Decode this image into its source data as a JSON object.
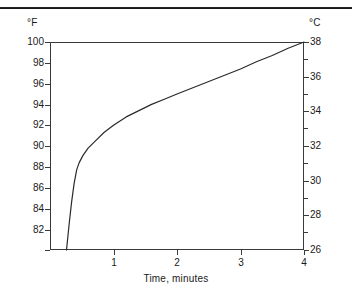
{
  "figure": {
    "left_axis_unit": "°F",
    "right_axis_unit": "°C",
    "xlabel": "Time, minutes",
    "line_color": "#2a2a2a",
    "frame_color": "#3a3a3a",
    "background": "#ffffff"
  },
  "chart_data": {
    "type": "line",
    "title": "",
    "subtitle": "",
    "xlabel": "Time, minutes",
    "ylabel": "°F",
    "y2label": "°C",
    "xlim": [
      0,
      4
    ],
    "ylim": [
      80,
      100
    ],
    "y2lim": [
      26,
      38
    ],
    "grid": false,
    "legend": null,
    "x_ticks": [
      1,
      2,
      3,
      4
    ],
    "x_tick_labels": [
      "1",
      "2",
      "3",
      "4"
    ],
    "y_ticks": [
      100,
      98,
      96,
      94,
      92,
      90,
      88,
      86,
      84,
      82,
      80
    ],
    "y_tick_labels": [
      "100",
      "98",
      "96",
      "94",
      "92",
      "90",
      "88",
      "86",
      "84",
      "82",
      ""
    ],
    "y2_ticks": [
      38,
      37,
      36,
      35,
      34,
      33,
      32,
      31,
      30,
      29,
      28,
      27,
      26
    ],
    "y2_tick_labels": [
      "38",
      "",
      "36",
      "",
      "34",
      "",
      "32",
      "",
      "30",
      "",
      "28",
      "",
      "26"
    ],
    "series": [
      {
        "name": "temperature",
        "x": [
          0.26,
          0.3,
          0.34,
          0.38,
          0.42,
          0.46,
          0.52,
          0.6,
          0.7,
          0.85,
          1.0,
          1.2,
          1.4,
          1.6,
          1.8,
          2.0,
          2.25,
          2.5,
          2.75,
          3.0,
          3.25,
          3.5,
          3.75,
          4.0
        ],
        "y": [
          80.0,
          82.4,
          84.6,
          86.4,
          87.7,
          88.4,
          89.1,
          89.8,
          90.4,
          91.3,
          92.0,
          92.8,
          93.4,
          94.0,
          94.5,
          95.0,
          95.6,
          96.2,
          96.8,
          97.4,
          98.1,
          98.7,
          99.4,
          100.0
        ],
        "y_celsius": [
          26.7,
          28.0,
          29.2,
          30.2,
          30.9,
          31.3,
          31.7,
          32.1,
          32.4,
          32.9,
          33.3,
          33.8,
          34.1,
          34.4,
          34.7,
          35.0,
          35.3,
          35.7,
          36.0,
          36.3,
          36.7,
          37.1,
          37.4,
          38.0
        ]
      }
    ]
  },
  "ticks": {
    "left_major": [
      {
        "label": "100",
        "y": 42
      },
      {
        "label": "98",
        "y": 63
      },
      {
        "label": "96",
        "y": 84
      },
      {
        "label": "94",
        "y": 105
      },
      {
        "label": "92",
        "y": 125
      },
      {
        "label": "90",
        "y": 146
      },
      {
        "label": "88",
        "y": 167
      },
      {
        "label": "86",
        "y": 188
      },
      {
        "label": "84",
        "y": 209
      },
      {
        "label": "82",
        "y": 230
      },
      {
        "label": "",
        "y": 250
      }
    ],
    "right_major": [
      {
        "label": "38",
        "y": 42
      },
      {
        "label": "36",
        "y": 77
      },
      {
        "label": "34",
        "y": 111
      },
      {
        "label": "32",
        "y": 146
      },
      {
        "label": "30",
        "y": 181
      },
      {
        "label": "28",
        "y": 215
      },
      {
        "label": "26",
        "y": 250
      }
    ],
    "right_minor": [
      {
        "y": 59
      },
      {
        "y": 94
      },
      {
        "y": 128
      },
      {
        "y": 163
      },
      {
        "y": 198
      },
      {
        "y": 232
      }
    ],
    "bottom": [
      {
        "label": "1",
        "x": 114
      },
      {
        "label": "2",
        "x": 177
      },
      {
        "label": "3",
        "x": 241
      },
      {
        "label": "4",
        "x": 304
      }
    ]
  }
}
